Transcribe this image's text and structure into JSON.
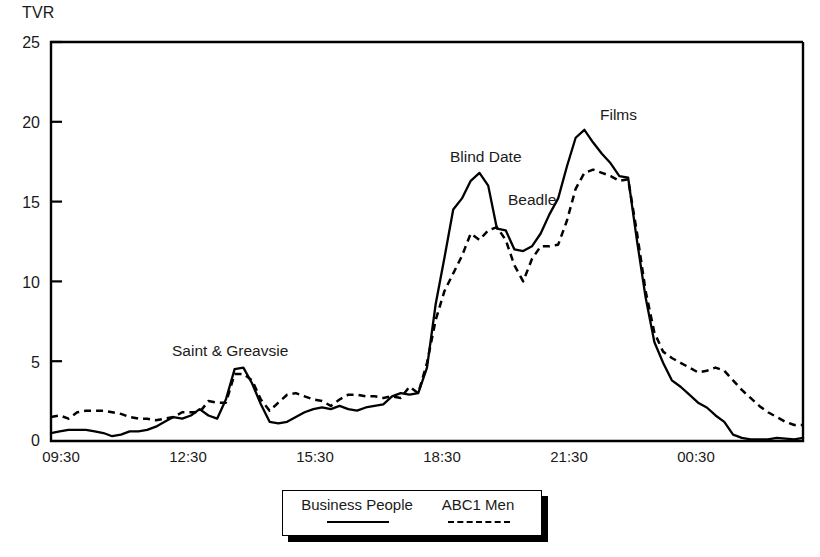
{
  "chart_data": {
    "type": "line",
    "title": "",
    "xlabel": "",
    "ylabel": "TVR",
    "ylim": [
      0,
      25
    ],
    "yticks": [
      0,
      5,
      10,
      15,
      20,
      25
    ],
    "xticks": [
      "09:30",
      "12:30",
      "15:30",
      "18:30",
      "21:30",
      "00:30"
    ],
    "grid": false,
    "legend_position": "bottom",
    "x_start_minutes": 570,
    "x_end_minutes": 1530,
    "x_step_minutes": 15,
    "series": [
      {
        "name": "Business People",
        "style": "solid",
        "color": "#000000",
        "values": [
          0.5,
          0.6,
          0.7,
          0.7,
          0.7,
          0.6,
          0.5,
          0.3,
          0.4,
          0.6,
          0.6,
          0.7,
          0.9,
          1.2,
          1.5,
          1.4,
          1.6,
          2.0,
          1.6,
          1.4,
          2.6,
          4.5,
          4.6,
          3.6,
          2.3,
          1.2,
          1.1,
          1.2,
          1.5,
          1.8,
          2.0,
          2.1,
          2.0,
          2.2,
          2.0,
          1.9,
          2.1,
          2.2,
          2.3,
          2.8,
          3.0,
          2.9,
          3.0,
          4.6,
          8.6,
          11.5,
          14.5,
          15.2,
          16.3,
          16.8,
          16.0,
          13.3,
          13.2,
          12.0,
          11.9,
          12.2,
          13.0,
          14.2,
          15.2,
          17.2,
          19.0,
          19.5,
          18.7,
          18.0,
          17.4,
          16.6,
          16.5,
          12.6,
          9.0,
          6.2,
          4.9,
          3.8,
          3.4,
          2.9,
          2.4,
          2.1,
          1.6,
          1.2,
          0.4,
          0.2,
          0.1,
          0.1,
          0.1,
          0.2,
          0.15,
          0.1,
          0.2
        ],
        "values_note": "TVR values sampled at 15-minute intervals from 09:30"
      },
      {
        "name": "ABC1 Men",
        "style": "dashed",
        "color": "#000000",
        "values": [
          1.5,
          1.6,
          1.4,
          1.8,
          1.9,
          1.9,
          1.9,
          1.8,
          1.7,
          1.5,
          1.4,
          1.4,
          1.3,
          1.4,
          1.5,
          1.8,
          1.8,
          1.8,
          2.5,
          2.4,
          2.4,
          4.2,
          4.2,
          3.8,
          2.6,
          1.9,
          2.4,
          2.9,
          3.0,
          2.8,
          2.6,
          2.5,
          2.2,
          2.6,
          2.9,
          2.9,
          2.8,
          2.8,
          2.7,
          2.8,
          2.7,
          3.4,
          3.0,
          4.9,
          7.6,
          9.4,
          10.5,
          11.6,
          13.0,
          12.6,
          13.2,
          13.4,
          12.6,
          11.0,
          10.0,
          11.4,
          12.2,
          12.2,
          12.3,
          13.8,
          15.8,
          16.8,
          17.0,
          16.8,
          16.6,
          16.3,
          16.4,
          13.1,
          9.4,
          6.8,
          5.6,
          5.2,
          4.9,
          4.6,
          4.3,
          4.4,
          4.6,
          4.4,
          3.8,
          3.2,
          2.7,
          2.2,
          1.8,
          1.5,
          1.2,
          1.0,
          1.0
        ],
        "values_note": "TVR values sampled at 15-minute intervals from 09:30"
      }
    ],
    "annotations": [
      {
        "label": "Saint & Greavsie",
        "x_px": 172,
        "y_px": 342
      },
      {
        "label": "Blind Date",
        "x_px": 450,
        "y_px": 148
      },
      {
        "label": "Beadle",
        "x_px": 508,
        "y_px": 191
      },
      {
        "label": "Films",
        "x_px": 600,
        "y_px": 106
      }
    ],
    "legend": [
      {
        "label": "Business People",
        "style": "solid"
      },
      {
        "label": "ABC1 Men",
        "style": "dashed"
      }
    ]
  }
}
